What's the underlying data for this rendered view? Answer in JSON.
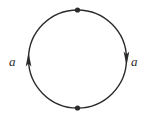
{
  "figure": {
    "background_color": "#ffffff",
    "stroke_color": "#2b2b2b",
    "labels": {
      "left": "a",
      "right": "a"
    },
    "circle": {
      "center_x": 77.5,
      "center_y": 59,
      "radius": 49,
      "stroke_width": 1.4
    },
    "markers": [
      {
        "name": "top-point",
        "x": 77.5,
        "y": 10,
        "radius": 2.6,
        "fill": "#2b2b2b"
      },
      {
        "name": "bottom-point",
        "x": 77.5,
        "y": 108,
        "radius": 2.6,
        "fill": "#2b2b2b"
      }
    ],
    "arrows": [
      {
        "name": "left-arrow",
        "direction": "up",
        "tip_x": 28.5,
        "tip_y": 53,
        "label": "a"
      },
      {
        "name": "right-arrow",
        "direction": "down",
        "tip_x": 126.5,
        "tip_y": 65,
        "label": "a"
      }
    ]
  }
}
